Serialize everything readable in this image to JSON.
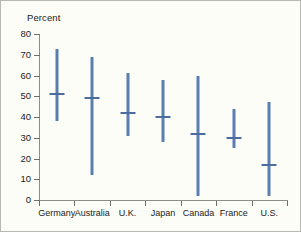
{
  "chart_data": {
    "type": "bar",
    "title": "",
    "subtitle": "",
    "xlabel": "",
    "ylabel": "Percent",
    "ylim": [
      0,
      80
    ],
    "ytick_step": 10,
    "yticks": [
      80,
      70,
      60,
      50,
      40,
      30,
      20,
      10,
      0
    ],
    "grid": false,
    "legend": null,
    "categories": [
      "Germany",
      "Australia",
      "U.K.",
      "Japan",
      "Canada",
      "France",
      "U.S."
    ],
    "series": [
      {
        "name": "High",
        "values": [
          73,
          69,
          61,
          58,
          60,
          44,
          47
        ]
      },
      {
        "name": "Median",
        "values": [
          51,
          49,
          42,
          40,
          32,
          30,
          17
        ]
      },
      {
        "name": "Low",
        "values": [
          38,
          12,
          31,
          28,
          2,
          25,
          2
        ]
      }
    ]
  },
  "style": {
    "bar_color": "#5b7db1",
    "median_color": "#4a6d9e",
    "axis_color": "#8d8d88",
    "text_color": "#1b1b1b",
    "background": "#fdfdf8",
    "border_color": "#b9b9b4"
  }
}
